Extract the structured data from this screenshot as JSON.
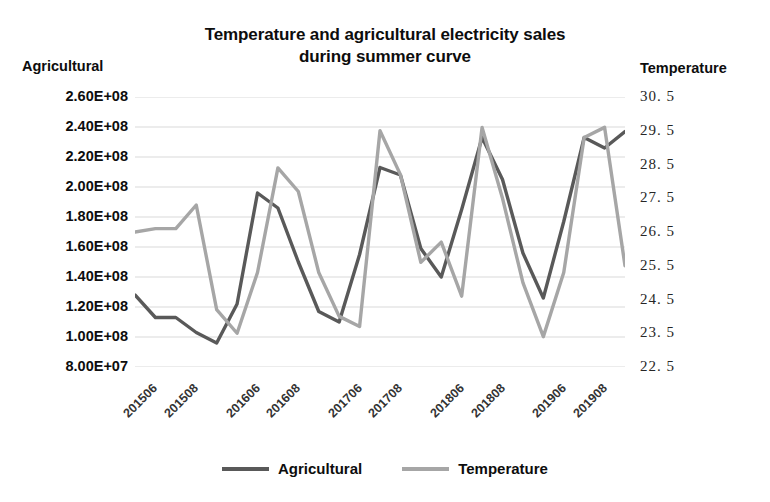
{
  "chart_data": {
    "type": "line",
    "title": "Temperature and agricultural electricity sales during summer curve",
    "title_line1": "Temperature and agricultural electricity sales",
    "title_line2": "during summer curve",
    "xlabel": "",
    "left_axis_label": "Agricultural",
    "right_axis_label": "Temperature",
    "grid": true,
    "legend_position": "bottom",
    "x": [
      "201505",
      "201506",
      "201507",
      "201508",
      "201509",
      "201605",
      "201606",
      "201607",
      "201608",
      "201609",
      "201705",
      "201706",
      "201707",
      "201708",
      "201709",
      "201805",
      "201806",
      "201807",
      "201808",
      "201809",
      "201905",
      "201906",
      "201907",
      "201908",
      "201909"
    ],
    "xtick_labels": [
      "201506",
      "201508",
      "201606",
      "201608",
      "201706",
      "201708",
      "201806",
      "201808",
      "201906",
      "201908"
    ],
    "ylim_left": [
      80000000,
      260000000
    ],
    "ytick_labels_left": [
      "2.60E+08",
      "2.40E+08",
      "2.20E+08",
      "2.00E+08",
      "1.80E+08",
      "1.60E+08",
      "1.40E+08",
      "1.20E+08",
      "1.00E+08",
      "8.00E+07"
    ],
    "ytick_values_left": [
      260000000,
      240000000,
      220000000,
      200000000,
      180000000,
      160000000,
      140000000,
      120000000,
      100000000,
      80000000
    ],
    "ylim_right": [
      22.5,
      30.5
    ],
    "ytick_labels_right": [
      "30. 5",
      "29. 5",
      "28. 5",
      "27. 5",
      "26. 5",
      "25. 5",
      "24. 5",
      "23. 5",
      "22. 5"
    ],
    "ytick_values_right": [
      30.5,
      29.5,
      28.5,
      27.5,
      26.5,
      25.5,
      24.5,
      23.5,
      22.5
    ],
    "series": [
      {
        "name": "Agricultural",
        "axis": "left",
        "color": "#595959",
        "values": [
          128000000,
          113000000,
          113000000,
          103000000,
          96000000,
          122000000,
          196000000,
          186000000,
          150000000,
          117000000,
          110000000,
          155000000,
          213000000,
          208000000,
          159000000,
          140000000,
          185000000,
          233000000,
          205000000,
          156000000,
          126000000,
          177000000,
          233000000,
          226000000,
          237000000
        ]
      },
      {
        "name": "Temperature",
        "axis": "right",
        "color": "#a6a6a6",
        "values": [
          26.5,
          26.6,
          26.6,
          27.3,
          24.2,
          23.5,
          25.3,
          28.4,
          27.7,
          25.3,
          24.0,
          23.7,
          29.5,
          28.2,
          25.6,
          26.2,
          24.6,
          29.6,
          27.5,
          25.0,
          23.4,
          25.3,
          29.3,
          29.6,
          25.5
        ]
      }
    ]
  },
  "legend": {
    "items": [
      {
        "label": "Agricultural",
        "color": "#595959"
      },
      {
        "label": "Temperature",
        "color": "#a6a6a6"
      }
    ]
  }
}
